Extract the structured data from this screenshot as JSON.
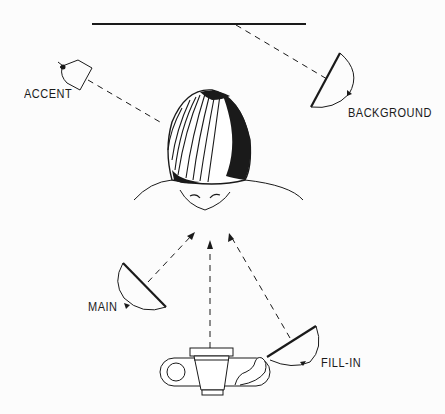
{
  "diagram": {
    "labels": {
      "accent": "ACCENT",
      "background": "BACKGROUND",
      "main": "MAIN",
      "fill_in": "FILL-IN"
    },
    "elements": [
      {
        "id": "backdrop",
        "type": "line",
        "description": "background wall"
      },
      {
        "id": "accent-light",
        "type": "lamp",
        "label": "ACCENT"
      },
      {
        "id": "background-light",
        "type": "lamp",
        "label": "BACKGROUND"
      },
      {
        "id": "subject",
        "type": "head",
        "description": "subject seen from above"
      },
      {
        "id": "main-light",
        "type": "lamp",
        "label": "MAIN"
      },
      {
        "id": "fill-in-light",
        "type": "lamp",
        "label": "FILL-IN"
      },
      {
        "id": "camera",
        "type": "camera",
        "description": "camera seen from above"
      }
    ],
    "colors": {
      "ink": "#1a1a1a",
      "paper": "#fcfcfc"
    }
  }
}
